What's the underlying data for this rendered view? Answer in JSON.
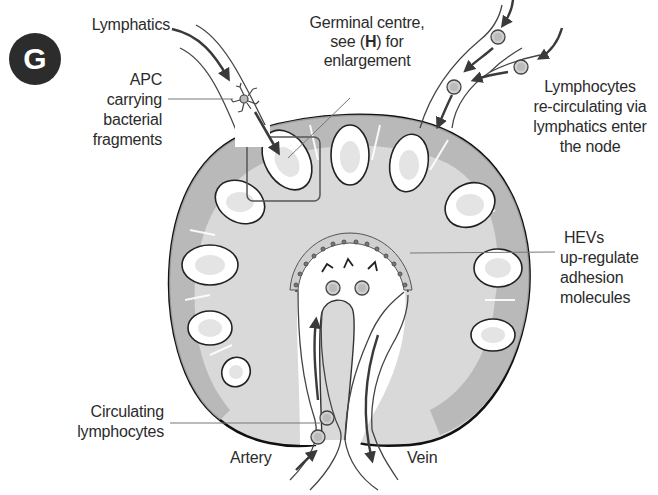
{
  "figure": {
    "panel_letter": "G",
    "colors": {
      "capsule_outline": "#111111",
      "cortex_dark": "#b3b3b3",
      "medulla_light": "#d9d9d9",
      "follicle_fill": "#ffffff",
      "germinal_centre": "#e4e4e4",
      "arrow": "#3a3a3a",
      "badge": "#2c2c2c"
    }
  },
  "labels": {
    "lymphatics": "Lymphatics",
    "germinal_centre": {
      "line1": "Germinal centre,",
      "line2_pre": "see (",
      "line2_bold": "H",
      "line2_post": ") for",
      "line3": "enlargement"
    },
    "apc": [
      "APC",
      "carrying",
      "bacterial",
      "fragments"
    ],
    "lymphocytes_recirculating": [
      "Lymphocytes",
      "re-circulating via",
      "lymphatics enter",
      "the node"
    ],
    "hevs": [
      "HEVs",
      "up-regulate",
      "adhesion",
      "molecules"
    ],
    "circulating_lymphocytes": [
      "Circulating",
      "lymphocytes"
    ],
    "artery": "Artery",
    "vein": "Vein"
  }
}
